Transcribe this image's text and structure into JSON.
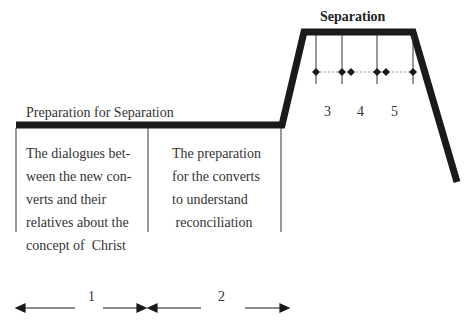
{
  "diagram": {
    "type": "stage-profile",
    "stages": [
      {
        "label": "Preparation for Separation",
        "level": "low"
      },
      {
        "label": "Separation",
        "level": "high"
      }
    ],
    "cells": [
      {
        "id": 1,
        "lines": [
          "The dialogues bet-",
          "ween the new con-",
          "verts and their",
          "relatives about the",
          "concept of  Christ"
        ]
      },
      {
        "id": 2,
        "lines": [
          "The preparation",
          "for the converts",
          "to understand",
          " reconciliation"
        ]
      }
    ],
    "separation_sub_phases": [
      "3",
      "4",
      "5"
    ],
    "span_labels": [
      "1",
      "2"
    ]
  }
}
